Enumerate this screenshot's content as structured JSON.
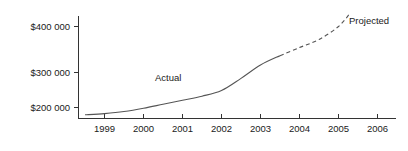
{
  "chart_data": {
    "type": "line",
    "title": "",
    "subtitle": "",
    "xlabel": "",
    "ylabel": "",
    "grid": false,
    "legend_position": "inline-annotation",
    "x": [
      1998.5,
      1999,
      2000,
      2001,
      2002,
      2003,
      2003.5,
      2004,
      2005,
      2005.3
    ],
    "xlim": [
      1998.35,
      2006.5
    ],
    "ylim": [
      175000,
      440000
    ],
    "x_tick_labels": [
      "1999",
      "2000",
      "2001",
      "2002",
      "2003",
      "2004",
      "2005",
      "2006"
    ],
    "x_tick_values": [
      1999,
      2000,
      2001,
      2002,
      2003,
      2004,
      2005,
      2006
    ],
    "y_tick_labels": [
      "$400 000",
      "$300 000",
      "$200 000"
    ],
    "y_tick_values": [
      400000,
      300000,
      200000
    ],
    "series": [
      {
        "name": "Actual",
        "style": "solid",
        "color": "#555555",
        "x": [
          1998.5,
          1999,
          1999.5,
          2000,
          2000.5,
          2001,
          2001.5,
          2002,
          2002.5,
          2003,
          2003.5
        ],
        "values": [
          182000,
          185000,
          190000,
          198000,
          208000,
          218000,
          228000,
          242000,
          272000,
          305000,
          328000
        ]
      },
      {
        "name": "Projected",
        "style": "dashed",
        "color": "#555555",
        "x": [
          2003.5,
          2004,
          2004.5,
          2005,
          2005.3
        ],
        "values": [
          328000,
          348000,
          368000,
          400000,
          433000
        ]
      }
    ],
    "annotations": [
      {
        "text": "Actual",
        "x_px": 155,
        "y_px": 81
      },
      {
        "text": "Projected",
        "x_px": 349,
        "y_px": 24
      }
    ]
  },
  "axes": {
    "y_axis_name": "y-axis",
    "x_axis_name": "x-axis"
  }
}
